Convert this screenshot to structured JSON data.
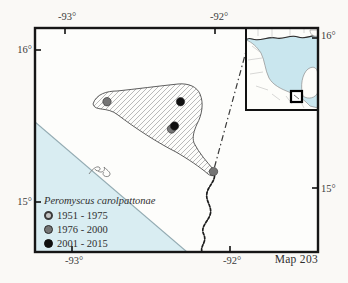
{
  "page": {
    "map_number": "Map 203"
  },
  "axis_labels": {
    "top_left_lon": "-93°",
    "top_right_lon": "-92°",
    "bottom_left_lon": "-93°",
    "bottom_right_lon": "-92°",
    "left_top_lat": "16°",
    "left_bottom_lat": "15°",
    "right_top_lat": "16°",
    "right_bottom_lat": "15°"
  },
  "legend": {
    "title": "Peromyscus carolpattonae",
    "items": [
      {
        "label": "1951 - 1975",
        "color": "#c3c3c3",
        "border": "#3a3a3a",
        "ring": "2px"
      },
      {
        "label": "1976 - 2000",
        "color": "#757575",
        "border": "#2b2b2b",
        "ring": "1.5px"
      },
      {
        "label": "2001 - 2015",
        "color": "#101010",
        "border": "#101010",
        "ring": "1.5px"
      }
    ]
  },
  "map_data": {
    "type": "occurrence-map",
    "species": "Peromyscus carolpattonae",
    "lon_ticks": [
      -93,
      -92
    ],
    "lat_ticks": [
      15,
      16
    ],
    "points": [
      {
        "lon": -92.72,
        "lat": 15.66,
        "period": "1976 - 2000"
      },
      {
        "lon": -92.23,
        "lat": 15.66,
        "period": "2001 - 2015"
      },
      {
        "lon": -92.29,
        "lat": 15.48,
        "period": "1976 - 2000"
      },
      {
        "lon": -92.27,
        "lat": 15.5,
        "period": "2001 - 2015"
      },
      {
        "lon": -92.01,
        "lat": 15.2,
        "period": "1976 - 2000"
      }
    ],
    "inset_region": "southern Mexico / Gulf of Mexico with study-area box"
  }
}
